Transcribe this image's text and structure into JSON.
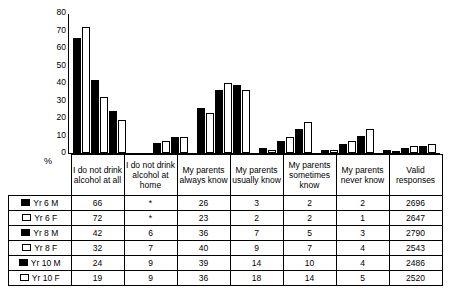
{
  "chart_data": {
    "type": "bar",
    "title": "",
    "xlabel": "",
    "ylabel": "%",
    "ylim": [
      0,
      80
    ],
    "yticks": [
      0,
      10,
      20,
      30,
      40,
      50,
      60,
      70,
      80
    ],
    "grid": false,
    "legend": "table",
    "categories": [
      "I do not drink alcohol at all",
      "I do not drink alcohol at home",
      "My parents always know",
      "My parents usually know",
      "My parents sometimes know",
      "My parents never know",
      "Valid responses"
    ],
    "series": [
      {
        "name": "Yr 6 M",
        "fill": "solid",
        "values": [
          66,
          "*",
          26,
          3,
          2,
          2,
          2696
        ]
      },
      {
        "name": "Yr 6 F",
        "fill": "hollow",
        "values": [
          72,
          "*",
          23,
          2,
          2,
          1,
          2647
        ]
      },
      {
        "name": "Yr 8 M",
        "fill": "solid",
        "values": [
          42,
          6,
          36,
          7,
          5,
          3,
          2790
        ]
      },
      {
        "name": "Yr 8 F",
        "fill": "hollow",
        "values": [
          32,
          7,
          40,
          9,
          7,
          4,
          2543
        ]
      },
      {
        "name": "Yr 10 M",
        "fill": "solid",
        "values": [
          24,
          9,
          39,
          14,
          10,
          4,
          2486
        ]
      },
      {
        "name": "Yr 10 F",
        "fill": "hollow",
        "values": [
          19,
          9,
          36,
          18,
          14,
          5,
          2520
        ]
      }
    ]
  },
  "axis": {
    "ylabel": "%",
    "ticks": [
      "80",
      "70",
      "60",
      "50",
      "40",
      "30",
      "20",
      "10",
      "0"
    ]
  },
  "table": {
    "headers": [
      "",
      "I do not drink alcohol at all",
      "I do not drink alcohol at home",
      "My parents always know",
      "My parents usually know",
      "My parents sometimes know",
      "My parents never know",
      "Valid responses"
    ],
    "rows": [
      {
        "label": "Yr 6 M",
        "fill": "solid",
        "cells": [
          "66",
          "*",
          "26",
          "3",
          "2",
          "2",
          "2696"
        ]
      },
      {
        "label": "Yr 6 F",
        "fill": "hollow",
        "cells": [
          "72",
          "*",
          "23",
          "2",
          "2",
          "1",
          "2647"
        ]
      },
      {
        "label": "Yr 8 M",
        "fill": "solid",
        "cells": [
          "42",
          "6",
          "36",
          "7",
          "5",
          "3",
          "2790"
        ]
      },
      {
        "label": "Yr 8 F",
        "fill": "hollow",
        "cells": [
          "32",
          "7",
          "40",
          "9",
          "7",
          "4",
          "2543"
        ]
      },
      {
        "label": "Yr 10 M",
        "fill": "solid",
        "cells": [
          "24",
          "9",
          "39",
          "14",
          "10",
          "4",
          "2486"
        ]
      },
      {
        "label": "Yr 10 F",
        "fill": "hollow",
        "cells": [
          "19",
          "9",
          "36",
          "18",
          "14",
          "5",
          "2520"
        ]
      }
    ]
  }
}
